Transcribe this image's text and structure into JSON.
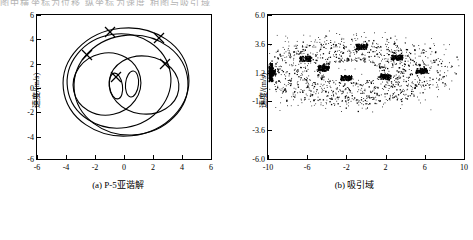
{
  "page": {
    "top_cut_text": "图中横坐标为位移 纵坐标为速度 相图与吸引域"
  },
  "panels": [
    {
      "id": "panel-a",
      "caption": "(a) P-5亚谐解",
      "y_axis_title": "速度/(m/s)",
      "x_ticks": [
        "-6",
        "-4",
        "-2",
        "0",
        "2",
        "4",
        "6"
      ],
      "y_ticks": [
        "6",
        "4",
        "2",
        "0",
        "-2",
        "-4",
        "-6"
      ]
    },
    {
      "id": "panel-b",
      "caption": "(b) 吸引域",
      "y_axis_title": "速度/(m/s)",
      "x_ticks": [
        "-10",
        "-6",
        "-2",
        "2",
        "6",
        "10"
      ],
      "y_ticks": [
        "6.0",
        "3.6",
        "1.2",
        "-1.2",
        "-3.6",
        "-6.0"
      ]
    }
  ],
  "chart_data": [
    {
      "type": "line",
      "title": "(a) P-5亚谐解",
      "xlabel": "",
      "ylabel": "速度/(m/s)",
      "xlim": [
        -6,
        6
      ],
      "ylim": [
        -6,
        6
      ],
      "xticks": [
        -6,
        -4,
        -2,
        0,
        2,
        4,
        6
      ],
      "yticks": [
        -6,
        -4,
        -2,
        0,
        2,
        4,
        6
      ],
      "grid": false,
      "legend": "none",
      "description": "Phase-plane trajectory of a period-5 subharmonic response: several nested near-elliptical orbits with two inner small loops near the origin.",
      "poincare_markers": {
        "symbol": "x",
        "count": 5,
        "points": [
          [
            -1.05,
            4.45
          ],
          [
            2.35,
            4.05
          ],
          [
            -2.55,
            2.65
          ],
          [
            2.75,
            1.95
          ],
          [
            -0.55,
            0.55
          ]
        ]
      },
      "orbits": [
        {
          "name": "outer-large",
          "cx": 0.15,
          "cy": 0.35,
          "rx": 4.35,
          "ry": 4.45
        },
        {
          "name": "outer-mid",
          "cx": 0.45,
          "cy": 0.15,
          "rx": 3.95,
          "ry": 4.15
        },
        {
          "name": "inner-left",
          "cx": -1.15,
          "cy": 0.25,
          "rx": 2.35,
          "ry": 2.55
        },
        {
          "name": "inner-right",
          "cx": 1.25,
          "cy": 0.15,
          "rx": 2.45,
          "ry": 2.35
        },
        {
          "name": "small-loop-left",
          "cx": -0.55,
          "cy": 0.05,
          "rx": 0.45,
          "ry": 1.05
        },
        {
          "name": "small-loop-right",
          "cx": 0.55,
          "cy": 0.25,
          "rx": 0.45,
          "ry": 1.05
        }
      ]
    },
    {
      "type": "scatter",
      "title": "(b) 吸引域",
      "xlabel": "",
      "ylabel": "速度/(m/s)",
      "xlim": [
        -10,
        10
      ],
      "ylim": [
        -6.0,
        6.0
      ],
      "xticks": [
        -10,
        -6,
        -2,
        2,
        6,
        10
      ],
      "yticks": [
        -6.0,
        -3.6,
        -1.2,
        1.2,
        3.6,
        6.0
      ],
      "grid": false,
      "legend": "none",
      "description": "Basin of attraction: dense fractal speckle forming banded elliptical rings centred slightly above the horizontal axis, with dark clumps near (-6,2.3), (-4,1.6), (-2,0.8), (2,0.9), (3,2.3) and a dense vertical streak at the left edge near x=-10.",
      "marker": "point",
      "marker_color": "#000000",
      "point_count_approx": 1500,
      "dense_clusters": [
        [
          -9.8,
          1.2
        ],
        [
          -6.2,
          2.4
        ],
        [
          -4.4,
          1.6
        ],
        [
          -2.1,
          0.8
        ],
        [
          1.9,
          0.9
        ],
        [
          3.1,
          2.5
        ],
        [
          5.6,
          1.4
        ],
        [
          -0.5,
          3.4
        ]
      ]
    }
  ]
}
